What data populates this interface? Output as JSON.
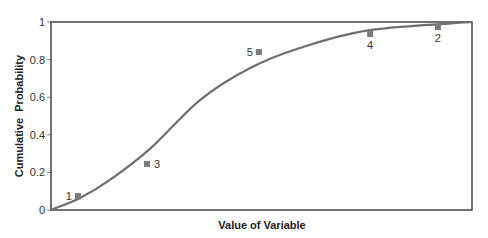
{
  "chart_data": {
    "type": "scatter",
    "title": "",
    "xlabel": "Value of Variable",
    "ylabel": "Cumulative  Probability",
    "ylim": [
      0,
      1
    ],
    "xlim": [
      0,
      1
    ],
    "yticks": [
      "0",
      "0.2",
      "0.4",
      "0.6",
      "0.8",
      "1"
    ],
    "xticks": [],
    "grid": false,
    "legend": null,
    "series": [
      {
        "name": "Cumulative distribution curve",
        "kind": "line",
        "x": [
          0.0,
          0.069,
          0.14,
          0.235,
          0.354,
          0.473,
          0.591,
          0.757,
          1.0
        ],
        "values": [
          0.0,
          0.064,
          0.16,
          0.325,
          0.585,
          0.755,
          0.862,
          0.957,
          1.0
        ]
      },
      {
        "name": "Observations",
        "kind": "scatter",
        "points": [
          {
            "label": "1",
            "x": 0.064,
            "y": 0.074
          },
          {
            "label": "3",
            "x": 0.228,
            "y": 0.245
          },
          {
            "label": "5",
            "x": 0.494,
            "y": 0.84
          },
          {
            "label": "4",
            "x": 0.758,
            "y": 0.936
          },
          {
            "label": "2",
            "x": 0.919,
            "y": 0.973
          }
        ]
      }
    ]
  },
  "plot_area": {
    "left": 51,
    "top": 22,
    "right": 472,
    "bottom": 210
  },
  "colors": {
    "curve": "#6e6e6e",
    "marker": "#7a7a7a",
    "frame": "#444444"
  }
}
